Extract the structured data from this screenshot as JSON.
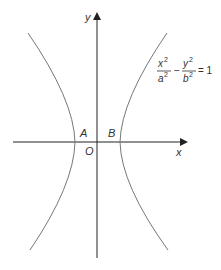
{
  "diagram": {
    "type": "hyperbola",
    "axes": {
      "x_label": "x",
      "y_label": "y",
      "origin_label": "O"
    },
    "vertices": {
      "left": "A",
      "right": "B"
    },
    "equation": {
      "x_term": "x",
      "a_term": "a",
      "y_term": "y",
      "b_term": "b",
      "exp": "2",
      "minus": "−",
      "equals": "= 1"
    },
    "colors": {
      "curve": "#777777",
      "axis": "#222222"
    }
  }
}
